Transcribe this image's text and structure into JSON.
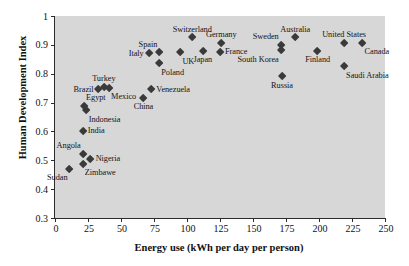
{
  "chart_data": {
    "type": "scatter",
    "title": "",
    "xlabel": "Energy use (kWh per day per person)",
    "ylabel": "Human Development Index",
    "xlim": [
      0,
      250
    ],
    "ylim": [
      0.3,
      1
    ],
    "xticks": [
      0,
      25,
      50,
      75,
      100,
      125,
      150,
      175,
      200,
      225,
      250
    ],
    "yticks": [
      "0.3",
      "0.4",
      "0.5",
      "0.6",
      "0.7",
      "0.8",
      "0.9",
      "1"
    ],
    "grid": false,
    "legend": "none",
    "marker": "diamond",
    "marker_color": "#3a3a3a",
    "plot_background": "#d7d7d7",
    "points": [
      {
        "label": "Sudan",
        "x": 11,
        "y": 0.47,
        "pos": "bl"
      },
      {
        "label": "Zimbawe",
        "x": 21,
        "y": 0.487,
        "pos": "br"
      },
      {
        "label": "Angola",
        "x": 21,
        "y": 0.522,
        "pos": "tl"
      },
      {
        "label": "Nigeria",
        "x": 27,
        "y": 0.503,
        "pos": "r"
      },
      {
        "label": "India",
        "x": 21,
        "y": 0.6,
        "pos": "r"
      },
      {
        "label": "Indonesia",
        "x": 24,
        "y": 0.672,
        "pos": "br"
      },
      {
        "label": "Egypt",
        "x": 22,
        "y": 0.687,
        "pos": "tr"
      },
      {
        "label": "Brazil",
        "x": 33,
        "y": 0.745,
        "pos": "l"
      },
      {
        "label": "Turkey",
        "x": 37,
        "y": 0.755,
        "pos": "t"
      },
      {
        "label": "Mexico",
        "x": 41,
        "y": 0.75,
        "pos": "br"
      },
      {
        "label": "China",
        "x": 67,
        "y": 0.715,
        "pos": "b"
      },
      {
        "label": "Venezuela",
        "x": 73,
        "y": 0.745,
        "pos": "r"
      },
      {
        "label": "Poland",
        "x": 79,
        "y": 0.835,
        "pos": "br"
      },
      {
        "label": "Italy",
        "x": 71,
        "y": 0.87,
        "pos": "l"
      },
      {
        "label": "Spain",
        "x": 79,
        "y": 0.873,
        "pos": "tl"
      },
      {
        "label": "UK",
        "x": 95,
        "y": 0.873,
        "pos": "br"
      },
      {
        "label": "Switzerland",
        "x": 104,
        "y": 0.925,
        "pos": "t"
      },
      {
        "label": "Japan",
        "x": 112,
        "y": 0.877,
        "pos": "b"
      },
      {
        "label": "France",
        "x": 125,
        "y": 0.875,
        "pos": "r"
      },
      {
        "label": "Germany",
        "x": 126,
        "y": 0.905,
        "pos": "t"
      },
      {
        "label": "Sweden",
        "x": 171,
        "y": 0.9,
        "pos": "tl"
      },
      {
        "label": "South Korea",
        "x": 171,
        "y": 0.88,
        "pos": "bl"
      },
      {
        "label": "Russia",
        "x": 172,
        "y": 0.79,
        "pos": "b"
      },
      {
        "label": "Australia",
        "x": 182,
        "y": 0.925,
        "pos": "t"
      },
      {
        "label": "Finland",
        "x": 199,
        "y": 0.877,
        "pos": "b"
      },
      {
        "label": "United States",
        "x": 219,
        "y": 0.905,
        "pos": "t"
      },
      {
        "label": "Saudi Arabia",
        "x": 219,
        "y": 0.825,
        "pos": "br"
      },
      {
        "label": "Canada",
        "x": 233,
        "y": 0.905,
        "pos": "br"
      }
    ]
  }
}
